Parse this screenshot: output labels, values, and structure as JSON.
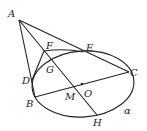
{
  "diagram": {
    "type": "geometry",
    "labels": {
      "A": "A",
      "F": "F",
      "E": "E",
      "C": "C",
      "G": "G",
      "D": "D",
      "B": "B",
      "M": "M",
      "O": "O",
      "H": "H",
      "alpha": "α"
    },
    "points": {
      "A": [
        19,
        20
      ],
      "F": [
        44,
        51
      ],
      "E": [
        83,
        52
      ],
      "C": [
        129,
        72
      ],
      "G": [
        46,
        63
      ],
      "D": [
        32,
        80
      ],
      "B": [
        35,
        97
      ],
      "M": [
        76,
        87
      ],
      "O": [
        82,
        84
      ],
      "H": [
        97,
        115
      ]
    },
    "ellipse": {
      "cx": 83,
      "cy": 84,
      "rx": 51,
      "ry": 33,
      "rotate": -4
    },
    "segments": [
      [
        "A",
        "C"
      ],
      [
        "A",
        "B"
      ],
      [
        "A",
        "H"
      ],
      [
        "F",
        "E"
      ],
      [
        "F",
        "D"
      ],
      [
        "B",
        "C"
      ]
    ]
  }
}
